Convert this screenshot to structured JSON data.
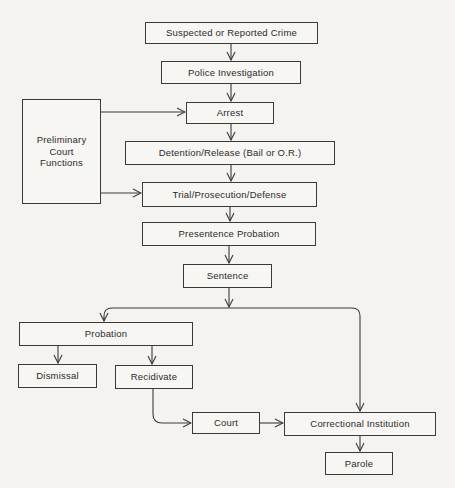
{
  "diagram": {
    "type": "flowchart",
    "nodes": {
      "crime": "Suspected or Reported Crime",
      "investigation": "Police Investigation",
      "arrest": "Arrest",
      "preliminary": "Preliminary Court Functions",
      "detention": "Detention/Release (Bail or O.R.)",
      "trial": "Trial/Prosecution/Defense",
      "presentence": "Presentence Probation",
      "sentence": "Sentence",
      "probation": "Probation",
      "dismissal": "Dismissal",
      "recidivate": "Recidivate",
      "court": "Court",
      "correctional": "Correctional Institution",
      "parole": "Parole"
    },
    "edges": [
      [
        "crime",
        "investigation"
      ],
      [
        "investigation",
        "arrest"
      ],
      [
        "preliminary",
        "arrest"
      ],
      [
        "arrest",
        "detention"
      ],
      [
        "detention",
        "trial"
      ],
      [
        "preliminary",
        "trial"
      ],
      [
        "trial",
        "presentence"
      ],
      [
        "presentence",
        "sentence"
      ],
      [
        "sentence",
        "probation"
      ],
      [
        "sentence",
        "correctional"
      ],
      [
        "probation",
        "dismissal"
      ],
      [
        "probation",
        "recidivate"
      ],
      [
        "recidivate",
        "court"
      ],
      [
        "court",
        "correctional"
      ],
      [
        "correctional",
        "parole"
      ]
    ]
  }
}
